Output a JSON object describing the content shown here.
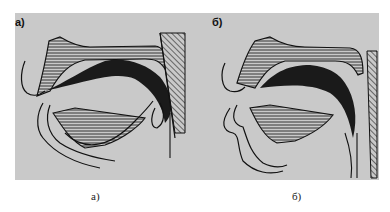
{
  "figure": {
    "panels": [
      {
        "id": "a",
        "label": "а)",
        "caption": "а)"
      },
      {
        "id": "b",
        "label": "б)",
        "caption": "б)"
      }
    ],
    "colors": {
      "background": "#c9c9c9",
      "ink": "#111111",
      "page": "#ffffff"
    }
  }
}
